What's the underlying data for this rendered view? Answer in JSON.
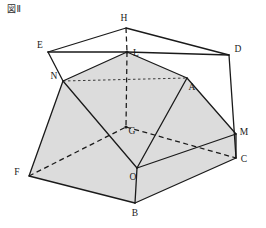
{
  "figure": {
    "caption": "図Ⅱ",
    "width": 266,
    "height": 228,
    "background_color": "#ffffff",
    "stroke_color": "#1a1a1a",
    "shaded_face_color": "#dcdcdc"
  },
  "vertices": [
    {
      "id": "H",
      "label": "H",
      "x": 126,
      "y": 28,
      "label_x": 124,
      "label_y": 18
    },
    {
      "id": "E",
      "label": "E",
      "x": 48,
      "y": 52,
      "label_x": 40,
      "label_y": 45
    },
    {
      "id": "L",
      "label": "L",
      "x": 127,
      "y": 52,
      "label_x": 136,
      "label_y": 53
    },
    {
      "id": "D",
      "label": "D",
      "x": 229,
      "y": 55,
      "label_x": 238,
      "label_y": 49
    },
    {
      "id": "N",
      "label": "N",
      "x": 63,
      "y": 81,
      "label_x": 54,
      "label_y": 76
    },
    {
      "id": "A",
      "label": "A",
      "x": 187,
      "y": 78,
      "label_x": 192,
      "label_y": 87
    },
    {
      "id": "G",
      "label": "G",
      "x": 126,
      "y": 127,
      "label_x": 132,
      "label_y": 131
    },
    {
      "id": "M",
      "label": "M",
      "x": 236,
      "y": 134,
      "label_x": 244,
      "label_y": 132
    },
    {
      "id": "C",
      "label": "C",
      "x": 236,
      "y": 158,
      "label_x": 244,
      "label_y": 159
    },
    {
      "id": "F",
      "label": "F",
      "x": 29,
      "y": 176,
      "label_x": 17,
      "label_y": 172
    },
    {
      "id": "O",
      "label": "O",
      "x": 137,
      "y": 168,
      "label_x": 133,
      "label_y": 177
    },
    {
      "id": "B",
      "label": "B",
      "x": 135,
      "y": 203,
      "label_x": 135,
      "label_y": 213
    }
  ],
  "edges": {
    "solid": [
      {
        "from": "E",
        "to": "H",
        "name": "edge-E-H"
      },
      {
        "from": "H",
        "to": "D",
        "name": "edge-H-D"
      },
      {
        "from": "E",
        "to": "L",
        "name": "edge-E-L"
      },
      {
        "from": "L",
        "to": "D",
        "name": "edge-L-D"
      },
      {
        "from": "E",
        "to": "N",
        "name": "edge-E-N"
      },
      {
        "from": "D",
        "to": "C",
        "name": "edge-D-C"
      },
      {
        "from": "N",
        "to": "L",
        "name": "edge-N-L"
      },
      {
        "from": "L",
        "to": "A",
        "name": "edge-L-A"
      },
      {
        "from": "N",
        "to": "F",
        "name": "edge-N-F"
      },
      {
        "from": "A",
        "to": "M",
        "name": "edge-A-M"
      },
      {
        "from": "N",
        "to": "O",
        "name": "edge-N-O"
      },
      {
        "from": "A",
        "to": "O",
        "name": "edge-A-O"
      },
      {
        "from": "F",
        "to": "B",
        "name": "edge-F-B"
      },
      {
        "from": "B",
        "to": "C",
        "name": "edge-B-C"
      },
      {
        "from": "O",
        "to": "B",
        "name": "edge-O-B"
      },
      {
        "from": "O",
        "to": "M",
        "name": "edge-O-M"
      },
      {
        "from": "M",
        "to": "C",
        "name": "edge-M-C"
      }
    ],
    "dashed": [
      {
        "from": "H",
        "to": "L",
        "name": "edge-H-L-hidden"
      },
      {
        "from": "L",
        "to": "G",
        "name": "edge-L-G-hidden"
      },
      {
        "from": "F",
        "to": "G",
        "name": "edge-F-G-hidden"
      },
      {
        "from": "G",
        "to": "C",
        "name": "edge-G-C-hidden"
      },
      {
        "from": "N",
        "to": "A",
        "name": "edge-N-A-hidden"
      }
    ]
  },
  "faces": [
    {
      "name": "face-N-L-A-O",
      "points": "N,L,A,O",
      "shaded": true
    },
    {
      "name": "face-F-N-O-B",
      "points": "F,N,O,B",
      "shaded": true
    },
    {
      "name": "face-O-A-M-C-B",
      "points": "O,A,M,C,B",
      "shaded": true
    }
  ]
}
